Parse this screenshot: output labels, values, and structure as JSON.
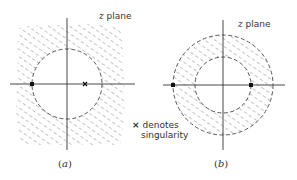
{
  "figure": {
    "panels": [
      {
        "id": "a",
        "caption_open": "(",
        "caption_letter": "a",
        "caption_close": ")",
        "plane_label_var": "z",
        "plane_label_text": " plane",
        "description": "Hatched region outside circle; one singularity on circle (left), one inside (right)"
      },
      {
        "id": "b",
        "caption_open": "(",
        "caption_letter": "b",
        "caption_close": ")",
        "plane_label_var": "z",
        "plane_label_text": " plane",
        "description": "Hatched annulus between two circles; singularities on outer circle (left) and within annulus (right)"
      }
    ],
    "legend": {
      "marker": "×",
      "line1": "denotes",
      "line2": "singularity"
    },
    "colors": {
      "line": "#333333",
      "hatch": "#9a9a9a",
      "background": "#ffffff"
    }
  }
}
